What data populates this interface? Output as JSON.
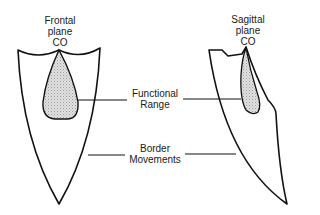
{
  "diagram": {
    "frontal": {
      "title_line1": "Frontal",
      "title_line2": "plane",
      "title_line3": "CO"
    },
    "sagittal": {
      "title_line1": "Sagittal",
      "title_line2": "plane",
      "title_line3": "CO"
    },
    "labels": {
      "functional_line1": "Functional",
      "functional_line2": "Range",
      "border_line1": "Border",
      "border_line2": "Movements"
    },
    "colors": {
      "stroke": "#111111",
      "fill_shaded": "#d9d9d9",
      "background": "#ffffff"
    }
  }
}
